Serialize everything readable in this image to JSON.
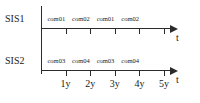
{
  "diagram": {
    "axis_variable": "t",
    "rows": [
      {
        "name": "SIS1",
        "slots": [
          "com01",
          "com02",
          "com01",
          "com02"
        ]
      },
      {
        "name": "SIS2",
        "slots": [
          "com03",
          "com04",
          "com03",
          "com04"
        ]
      }
    ],
    "tick_labels": [
      "1y",
      "2y",
      "3y",
      "4y",
      "5y"
    ],
    "colors": {
      "line": "#2b2b2b",
      "text": "#1a1a1a",
      "background": "#ffffff"
    }
  }
}
